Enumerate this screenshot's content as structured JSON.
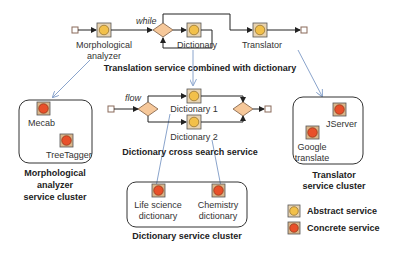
{
  "colors": {
    "abstract_fill": "#f2c04a",
    "concrete_fill": "#e8502a",
    "gateway_fill": "#f6c89a",
    "icon_frame": "#d9b58a",
    "line": "#222222",
    "link": "#8aa4cc"
  },
  "top_flow": {
    "while_label": "while",
    "nodes": {
      "morph": "Morphological",
      "morph2": "analyzer",
      "dictionary": "Dictionary",
      "translator": "Translator"
    },
    "caption": "Translation service combined with dictionary"
  },
  "middle_flow": {
    "flow_label": "flow",
    "nodes": {
      "dict1": "Dictionary 1",
      "dict2": "Dictionary 2"
    },
    "caption": "Dictionary cross search service"
  },
  "clusters": {
    "morph": {
      "items": [
        "Mecab",
        "TreeTagger"
      ],
      "caption": [
        "Morphological",
        "analyzer",
        "service cluster"
      ]
    },
    "translator": {
      "items": [
        "JServer",
        "Google",
        "translate"
      ],
      "caption": [
        "Translator",
        "service cluster"
      ]
    },
    "dictionary": {
      "items": [
        "Life science",
        "dictionary",
        "Chemistry",
        "dictionary"
      ],
      "caption": "Dictionary service cluster"
    }
  },
  "legend": {
    "abstract": "Abstract service",
    "concrete": "Concrete service"
  }
}
